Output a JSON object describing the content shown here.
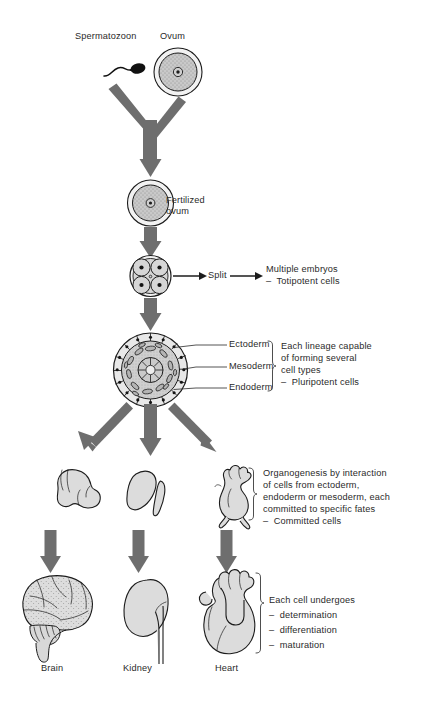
{
  "figure": {
    "background_color": "#ffffff",
    "arrow_color": "#6e6e6e",
    "cell_fill": "#d6d6d6",
    "outline_color": "#1c1c1c",
    "text_color": "#2a2a2a"
  },
  "labels": {
    "spermatozoon": "Spermatozoon",
    "ovum": "Ovum",
    "fertilized_ovum_line1": "Fertilized",
    "fertilized_ovum_line2": "ovum",
    "split": "Split",
    "multiple_embryos_line1": "Multiple embryos",
    "multiple_embryos_line2": "–  Totipotent cells",
    "ectoderm": "Ectoderm",
    "mesoderm": "Mesoderm",
    "endoderm": "Endoderm",
    "brain": "Brain",
    "kidney": "Kidney",
    "heart": "Heart"
  },
  "annotations": {
    "pluripotent": {
      "line1": "Each lineage capable",
      "line2": "of forming several",
      "line3": "cell types",
      "line4": "–  Pluripotent cells"
    },
    "committed": {
      "line1": "Organogenesis by interaction",
      "line2": "of cells from ectoderm,",
      "line3": "endoderm or mesoderm, each",
      "line4": "committed to specific fates",
      "line5": "–  Committed cells"
    },
    "maturation": {
      "line1": "Each cell undergoes",
      "line2": "–  determination",
      "line3": "–  differentiation",
      "line4": "–  maturation"
    }
  },
  "stages": [
    {
      "id": "gametes",
      "name": "Spermatozoon and ovum"
    },
    {
      "id": "zygote",
      "name": "Fertilized ovum"
    },
    {
      "id": "four-cell",
      "name": "Four-cell embryo"
    },
    {
      "id": "gastrula",
      "name": "Three germ layer embryo"
    },
    {
      "id": "organ-primordia",
      "name": "Organ primordia"
    },
    {
      "id": "mature-organs",
      "name": "Mature organs"
    }
  ]
}
